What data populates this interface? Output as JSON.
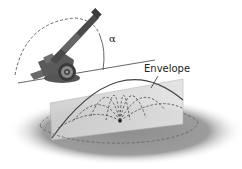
{
  "diagram": {
    "labels": {
      "envelope": "Envelope",
      "angle": "α"
    },
    "elements": [
      "cannon",
      "elevation-angle-arc",
      "ground-line",
      "vertical-plane",
      "trajectories",
      "envelope-curve",
      "range-circle",
      "shadow-disk"
    ],
    "colors": {
      "shadow": "#9a9a9a",
      "plane": "#d4d4d4",
      "trajectory": "#555555",
      "envelope": "#444444",
      "cannon": "#4a4a4a"
    }
  }
}
